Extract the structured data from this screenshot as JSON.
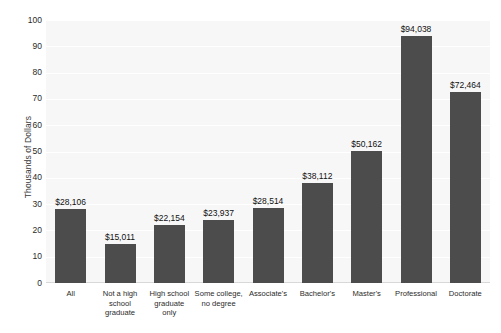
{
  "chart_data": {
    "type": "bar",
    "title": "",
    "xlabel": "",
    "ylabel": "Thousands of Dollars",
    "ylim": [
      0,
      100
    ],
    "ytick_step": 10,
    "yticks": [
      "100",
      "90",
      "80",
      "70",
      "60",
      "50",
      "40",
      "30",
      "20",
      "10",
      "0"
    ],
    "grid": true,
    "legend": "none",
    "bar_color": "#4c4c4c",
    "plot_background": "#f7f7f7",
    "gridline_color": "#ffffff",
    "categories": [
      "All",
      "Not a high\nschool\ngraduate",
      "High school\ngraduate\nonly",
      "Some college,\nno degree",
      "Associate's",
      "Bachelor's",
      "Master's",
      "Professional",
      "Doctorate"
    ],
    "values": [
      28.106,
      15.011,
      22.154,
      23.937,
      28.514,
      38.112,
      50.162,
      94.038,
      72.464
    ],
    "value_labels": [
      "$28,106",
      "$15,011",
      "$22,154",
      "$23,937",
      "$28,514",
      "$38,112",
      "$50,162",
      "$94,038",
      "$72,464"
    ]
  }
}
